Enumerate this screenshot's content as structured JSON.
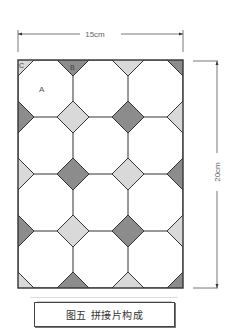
{
  "figure": {
    "width_label": "15cm",
    "height_label": "20cm",
    "caption": "图五 拼接片构成",
    "piece_labels": {
      "A": "A",
      "B": "B",
      "C": "C"
    },
    "colors": {
      "dark": "#8c8c8c",
      "light": "#d9d9d9",
      "white": "#ffffff",
      "outline": "#333333"
    },
    "grid": {
      "columns": 3,
      "rows": 4,
      "x_bounds": [
        18,
        73,
        128,
        183
      ],
      "y_bounds": [
        60,
        117,
        174,
        231,
        288
      ],
      "diamond_half": 16,
      "intersections": [
        [
          "light",
          "dark",
          "light",
          "dark"
        ],
        [
          "dark",
          "light",
          "dark",
          "light"
        ],
        [
          "light",
          "dark",
          "light",
          "dark"
        ],
        [
          "dark",
          "light",
          "dark",
          "light"
        ],
        [
          "light",
          "dark",
          "light",
          "dark"
        ]
      ]
    }
  }
}
